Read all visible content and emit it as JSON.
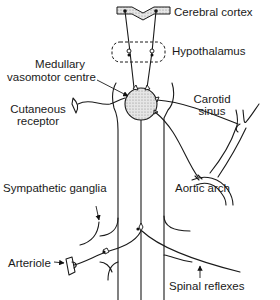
{
  "diagram": {
    "type": "neural-control-of-blood-vessels",
    "labels": {
      "cerebral_cortex": "Cerebral cortex",
      "hypothalamus": "Hypothalamus",
      "medullary_line1": "Medullary",
      "medullary_line2": "vasomotor centre",
      "cutaneous_line1": "Cutaneous",
      "cutaneous_line2": "receptor",
      "carotid_line1": "Carotid",
      "carotid_line2": "sinus",
      "aortic_arch": "Aortic arch",
      "sympathetic_ganglia": "Sympathetic ganglia",
      "arteriole": "Arteriole",
      "spinal_reflexes": "Spinal reflexes"
    },
    "colors": {
      "stroke": "#1a1a1a",
      "background": "#ffffff",
      "hatch": "#bdbdbd"
    }
  }
}
